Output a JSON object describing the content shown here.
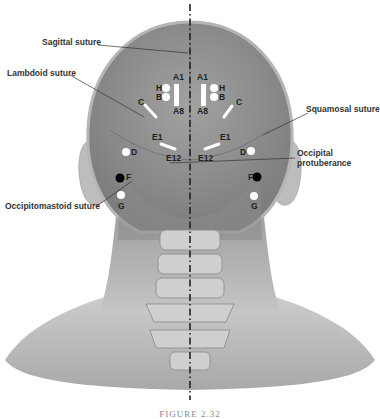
{
  "figure": {
    "caption": "FIGURE 2.32"
  },
  "labels": {
    "sagittal": "Sagittal suture",
    "lambdoid": "Lambdoid suture",
    "squamosal": "Squamosal suture",
    "occipital_1": "Occipital",
    "occipital_2": "protuberance",
    "occipitomastoid": "Occipitomastoid suture"
  },
  "points": {
    "a1_left": "A1",
    "a8_left": "A8",
    "a1_right": "A1",
    "a8_right": "A8",
    "h_left": "H",
    "b_left": "B",
    "h_right": "H",
    "b_right": "B",
    "c_left": "C",
    "c_right": "C",
    "e1_left": "E1",
    "e12_left": "E12",
    "e1_right": "E1",
    "e12_right": "E12",
    "d_left": "D",
    "d_right": "D",
    "f_left": "F",
    "f_right": "F",
    "g_left": "G",
    "g_right": "G"
  },
  "colors": {
    "skin": "#c8c8c8",
    "skull": "#8f8f8f",
    "marker_white": "#ffffff",
    "marker_black": "#000000",
    "midline": "#222222"
  }
}
